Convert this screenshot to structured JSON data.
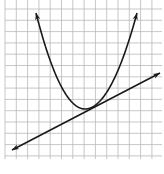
{
  "figure": {
    "type": "graph-paper-plot",
    "grid": {
      "x0": 5,
      "y0": -2,
      "x1": 162,
      "y1": 159,
      "spacing": 11.3,
      "line_color": "#b9b9b9"
    },
    "curve_color": "#1a1a1a",
    "parabola": {
      "label": "parabola-opening-upward",
      "vertex": [
        85,
        109
      ],
      "left_arrow_tip": [
        36,
        13
      ],
      "right_arrow_tip": [
        137,
        13
      ]
    },
    "tangent_line": {
      "label": "line-tangent-to-parabola",
      "start_arrow_tip": [
        12,
        150
      ],
      "end_arrow_tip": [
        160,
        73
      ],
      "tangent_point": [
        97,
        105
      ]
    }
  },
  "caption": {
    "text": ""
  }
}
